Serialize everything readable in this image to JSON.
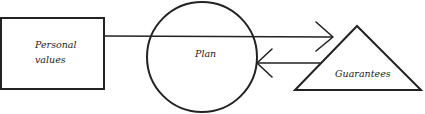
{
  "diagram": {
    "type": "flow",
    "nodes": [
      {
        "id": "personal_values",
        "shape": "rectangle",
        "label_lines": [
          "Personal",
          "values"
        ]
      },
      {
        "id": "plan",
        "shape": "circle",
        "label": "Plan"
      },
      {
        "id": "guarantees",
        "shape": "triangle",
        "label": "Guarantees"
      }
    ],
    "edges": [
      {
        "from": "personal_values",
        "to": "guarantees",
        "via": "plan",
        "direction": "right",
        "arrowhead": "open"
      },
      {
        "from": "guarantees",
        "to": "plan",
        "direction": "left",
        "arrowhead": "open"
      }
    ],
    "labels": {
      "personal_line1": "Personal",
      "personal_line2": "values",
      "plan": "Plan",
      "guarantees": "Guarantees"
    },
    "colors": {
      "stroke": "#222222",
      "background": "#ffffff"
    }
  }
}
